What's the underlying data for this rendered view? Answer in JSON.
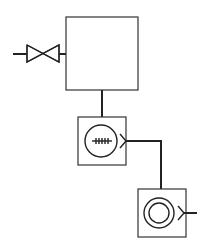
{
  "diagram": {
    "title": "",
    "type": "process-flow-schematic",
    "colors": {
      "stroke": "#222222",
      "background": "#ffffff"
    },
    "components": [
      {
        "id": "inlet-valve",
        "kind": "gate-valve",
        "label": ""
      },
      {
        "id": "tank",
        "kind": "vessel",
        "label": ""
      },
      {
        "id": "unit-1",
        "kind": "circular-element-with-hatched-axis",
        "label": ""
      },
      {
        "id": "unit-2",
        "kind": "concentric-circle-element",
        "label": ""
      }
    ],
    "connections": [
      {
        "from": "inlet",
        "to": "inlet-valve"
      },
      {
        "from": "inlet-valve",
        "to": "tank"
      },
      {
        "from": "tank",
        "to": "unit-1"
      },
      {
        "from": "unit-1",
        "to": "unit-2"
      },
      {
        "from": "unit-2",
        "to": "outlet"
      }
    ]
  }
}
